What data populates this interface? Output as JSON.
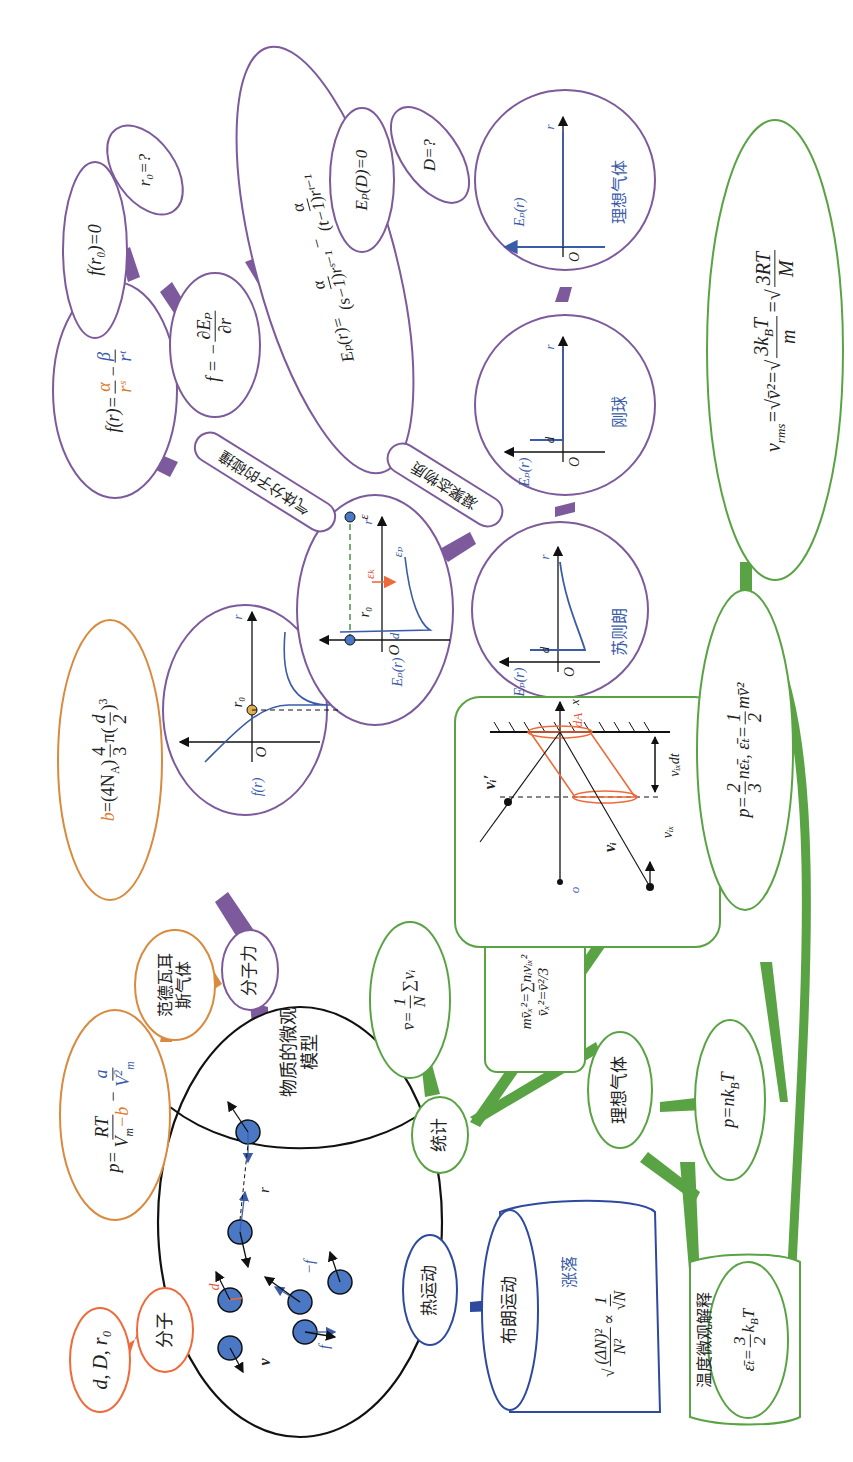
{
  "colors": {
    "molecule_branch": "#ef6a3a",
    "vdw_branch": "#d98a3e",
    "force_branch": "#7d5a9c",
    "statistics_branch": "#5aa344",
    "thermal_branch": "#2e4a9e",
    "center_outline": "#111111",
    "molecule_fill": "#4a78c4"
  },
  "center": {
    "title_line1": "物质的微观",
    "title_line2": "模型",
    "labels": {
      "d": "d",
      "r": "r",
      "v": "v",
      "f": "f",
      "neg_f": "−f"
    }
  },
  "molecule_branch": {
    "node": "分子",
    "params": "d, D, r₀"
  },
  "vdw_branch": {
    "node_line1": "范德瓦耳",
    "node_line2": "斯气体",
    "equation": {
      "lhs": "p=",
      "num": "RT",
      "den_a": "V",
      "den_sub": "m",
      "den_b": "−b",
      "minus": "−",
      "num2": "a",
      "den2": "V",
      "den2_sup": "2",
      "den2_sub": "m"
    },
    "b_equation": {
      "lhs": "b",
      "eq": "=(4N",
      "sub": "A",
      "rest": ")",
      "frac_num": "4",
      "frac_den": "3",
      "pi": "π",
      "paren_num": "d",
      "paren_den": "2",
      "exp": "3"
    }
  },
  "force_branch": {
    "node": "分子力",
    "f_graph": {
      "y_label": "f(r)",
      "x_label": "r",
      "origin": "O",
      "r0": "r₀"
    },
    "ep_graph": {
      "y_label": "Eₚ(r)",
      "x_label": "r",
      "origin": "O",
      "r0": "r₀",
      "d": "d",
      "eps": "ε",
      "eps_k": "εₖ",
      "eps_p": "εₚ"
    },
    "f_formula": {
      "lhs": "f(r)=",
      "a": "α",
      "rs": "rˢ",
      "minus": "−",
      "b": "β",
      "rt": "rᵗ"
    },
    "f_derivative": {
      "lhs": "f = −",
      "num": "∂Eₚ",
      "den": "∂r"
    },
    "f_r0": "f(r₀)=0",
    "r0_q": "r₀=?",
    "ep_formula": {
      "lhs": "Eₚ(r)=",
      "num1": "α",
      "den1": "(s−1)rˢ⁻¹",
      "minus": "−",
      "num2": "α",
      "den2": "(t−1)rᵗ⁻¹"
    },
    "ep_D": "Eₚ(D)=0",
    "D_q": "D=?",
    "gas_collision": "气体分子的碰撞",
    "condensed": "凝聚态物质",
    "models": [
      {
        "name": "苏则朗",
        "y_label": "Eₚ(r)",
        "x_label": "r",
        "origin": "O",
        "d": "d"
      },
      {
        "name": "刚球",
        "y_label": "Eₚ(r)",
        "x_label": "r",
        "origin": "O",
        "d": "d"
      },
      {
        "name": "理想气体",
        "y_label": "Eₚ(r)",
        "x_label": "r",
        "origin": "O"
      }
    ]
  },
  "statistics_branch": {
    "node": "统计",
    "mean_v": {
      "lhs": "v̄=",
      "num": "1",
      "den": "N",
      "rest": "∑vᵢ"
    },
    "box_line1": "mv̄ₓ²=∑nᵢvᵢₓ²",
    "box_line1_sup": "M",
    "box_line1_sub": "i",
    "box_line2": "v̄ₓ²=v̄²/3",
    "wall": {
      "dA": "dA",
      "x": "x",
      "o": "o",
      "vi_prime": "vᵢ′",
      "vi": "vᵢ",
      "vix": "vᵢₓ",
      "vixdt": "vᵢₓdt"
    },
    "pressure": {
      "lhs": "p=",
      "n1": "2",
      "d1": "3",
      "mid": "nε̄ₜ, ε̄ₜ=",
      "n2": "1",
      "d2": "2",
      "rest": "mv̄²"
    },
    "vrms": {
      "lhs": "v",
      "lhs_sub": "rms",
      "eq1": "=√v̄²=",
      "n1": "3k",
      "n1_sub": "B",
      "n1_rest": "T",
      "d1": "m",
      "eq2": "=",
      "n2": "3RT",
      "d2": "M"
    },
    "ideal_gas": "理想气体",
    "pnkT": {
      "text": "p=nk",
      "sub": "B",
      "rest": "T"
    },
    "temperature": {
      "title": "温度微观解释",
      "lhs": "ε̄ₜ=",
      "num": "3",
      "den": "2",
      "rest": "k",
      "sub": "B",
      "T": "T"
    }
  },
  "thermal_branch": {
    "node": "热运动",
    "brownian": "布朗运动",
    "fluctuation": "涨落",
    "formula": {
      "num": "(ΔN)²",
      "den": "N²",
      "prop": "∝",
      "num2": "1",
      "den2": "√N"
    }
  }
}
